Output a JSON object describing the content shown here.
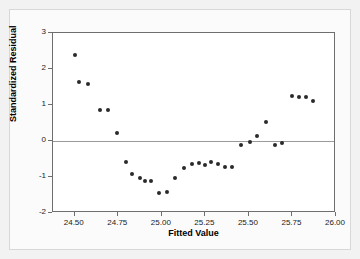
{
  "chart_data": {
    "type": "scatter",
    "title": "",
    "xlabel": "Fitted Value",
    "ylabel": "Standardized Residual",
    "xlim": [
      24.375,
      26.0
    ],
    "ylim": [
      -2,
      3
    ],
    "xticks": [
      "24.50",
      "24.75",
      "25.00",
      "25.25",
      "25.50",
      "25.75",
      "26.00"
    ],
    "xtick_values": [
      24.5,
      24.75,
      25.0,
      25.25,
      25.5,
      25.75,
      26.0
    ],
    "yticks": [
      "3",
      "2",
      "1",
      "0",
      "-1",
      "-2"
    ],
    "ytick_values": [
      3,
      2,
      1,
      0,
      -1,
      -2
    ],
    "grid": false,
    "legend": false,
    "zero_reference_line": 0,
    "marker_color": "#2a2a2a",
    "panel_border_color": "#6e6e6e",
    "background_color": "#f2f2f2",
    "panel_color": "#ffffff",
    "series": [
      {
        "name": "Standardized Residual",
        "x": [
          24.5,
          24.523,
          24.578,
          24.645,
          24.69,
          24.745,
          24.792,
          24.83,
          24.872,
          24.905,
          24.94,
          24.985,
          25.028,
          25.075,
          25.128,
          25.172,
          25.212,
          25.245,
          25.285,
          25.325,
          25.362,
          25.405,
          25.455,
          25.505,
          25.548,
          25.598,
          25.648,
          25.69,
          25.748,
          25.788,
          25.828,
          25.87
        ],
        "y": [
          2.4,
          1.63,
          1.57,
          0.86,
          0.87,
          0.22,
          -0.57,
          -0.92,
          -1.03,
          -1.1,
          -1.1,
          -1.45,
          -1.42,
          -1.04,
          -0.74,
          -0.63,
          -0.62,
          -0.66,
          -0.57,
          -0.63,
          -0.71,
          -0.71,
          -0.12,
          -0.02,
          0.15,
          0.54,
          -0.12,
          -0.05,
          1.26,
          1.22,
          1.22,
          1.12
        ]
      }
    ]
  },
  "axis": {
    "y_title": "Standardized Residual",
    "x_title": "Fitted Value"
  }
}
